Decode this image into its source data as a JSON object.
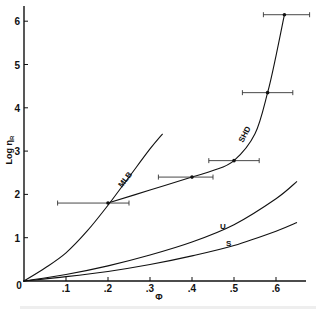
{
  "chart_data": {
    "type": "line",
    "title": "",
    "xlabel": "Φ",
    "ylabel": "Log η_R",
    "xlim": [
      0,
      0.67
    ],
    "ylim": [
      0,
      6.3
    ],
    "x_ticks": [
      ".1",
      ".2",
      ".3",
      ".4",
      ".5",
      ".6"
    ],
    "y_ticks": [
      "1",
      "2",
      "3",
      "4",
      "5",
      "6"
    ],
    "origin_label": "0",
    "grid": false,
    "legend": "none (inline curve labels)",
    "series": [
      {
        "name": "MLB",
        "x": [
          0,
          0.05,
          0.1,
          0.15,
          0.2,
          0.25,
          0.3,
          0.33
        ],
        "y": [
          0,
          0.3,
          0.65,
          1.15,
          1.75,
          2.4,
          3.05,
          3.4
        ]
      },
      {
        "name": "SHD",
        "x": [
          0.2,
          0.3,
          0.4,
          0.45,
          0.5,
          0.55,
          0.58,
          0.6,
          0.62
        ],
        "y": [
          1.8,
          2.1,
          2.4,
          2.55,
          2.78,
          3.4,
          4.35,
          5.2,
          6.15
        ],
        "data_points": [
          {
            "x": 0.2,
            "y": 1.8,
            "x_err": [
              0.08,
              0.25
            ]
          },
          {
            "x": 0.4,
            "y": 2.4,
            "x_err": [
              0.32,
              0.45
            ]
          },
          {
            "x": 0.5,
            "y": 2.78,
            "x_err": [
              0.44,
              0.56
            ]
          },
          {
            "x": 0.58,
            "y": 4.35,
            "x_err": [
              0.52,
              0.64
            ]
          },
          {
            "x": 0.62,
            "y": 6.15,
            "x_err": [
              0.57,
              0.68
            ]
          }
        ]
      },
      {
        "name": "U",
        "x": [
          0,
          0.1,
          0.2,
          0.3,
          0.4,
          0.5,
          0.6,
          0.65
        ],
        "y": [
          0,
          0.15,
          0.35,
          0.6,
          0.9,
          1.3,
          1.9,
          2.3
        ]
      },
      {
        "name": "S",
        "x": [
          0,
          0.1,
          0.2,
          0.3,
          0.4,
          0.5,
          0.6,
          0.65
        ],
        "y": [
          0,
          0.1,
          0.22,
          0.38,
          0.58,
          0.82,
          1.15,
          1.35
        ]
      }
    ]
  },
  "labels": {
    "y_axis": "Log η",
    "y_axis_sub": "R",
    "x_axis": "Φ",
    "origin": "0",
    "mlb": "MLB",
    "shd": "SHD",
    "u": "U",
    "s": "S"
  }
}
